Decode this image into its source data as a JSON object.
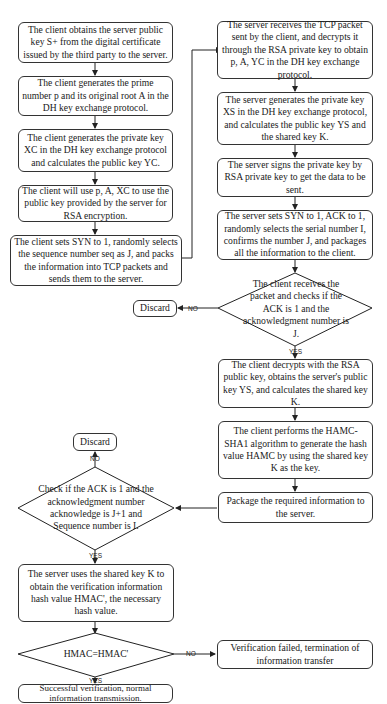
{
  "nodes": {
    "c1": "The client obtains the server public key S+ from the digital certificate issued by the third party to the server.",
    "c2": "The client generates the prime number p and its original root A in the DH key exchange protocol.",
    "c3": "The client generates the private key XC in the DH key exchange protocol and calculates the public key YC.",
    "c4": "The client will use p, A, XC to use the public key provided by the server for RSA encryption.",
    "c5": "The client sets SYN to 1, randomly selects the sequence number seq as J, and packs the information into TCP packets and sends them to the server.",
    "s1": "The server receives the TCP packet sent by the client, and decrypts it through the RSA private key to obtain p, A, YC in the DH key exchange protocol.",
    "s2": "The server generates the private key XS in the DH key exchange protocol, and calculates the public key YS and the shared key K.",
    "s3": "The server signs the private key by RSA private key to get the data to be sent.",
    "s4": "The server sets SYN to 1, ACK to 1, randomly selects the serial number I, confirms the number J, and packages all the information to the client.",
    "d1": "The client receives the packet and checks if the ACK is 1 and the acknowledgment number is J.",
    "discard1": "Discard",
    "r1": "The client decrypts with the RSA public key, obtains the server's public key YS, and calculates the shared key K.",
    "r2": "The client performs the HAMC-SHA1 algorithm to generate the hash value HAMC by using the shared key K as the key.",
    "r3": "Package the required information to the server.",
    "d2": "Check if the ACK is 1 and the acknowledgment number acknowledge is J+1 and Sequence number is I.",
    "discard2": "Discard",
    "v1": "The server uses the shared key K to obtain the verification information hash value HMAC', the necessary hash value.",
    "d3": "HMAC=HMAC'",
    "fail": "Verification failed, termination of information transfer",
    "success": "Successful verification, normal information transmission."
  },
  "labels": {
    "no": "NO",
    "yes": "YES"
  }
}
